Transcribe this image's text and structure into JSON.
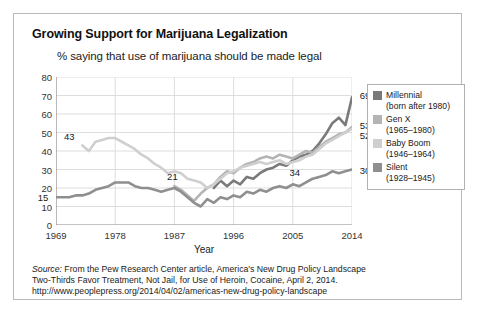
{
  "figure": {
    "title": "Growing Support for Marijuana Legalization",
    "subtitle": "% saying that use of marijuana should be made legal"
  },
  "source": {
    "prefix": "Source:",
    "line1": " From the Pew Research Center article, America's New Drug Policy Landscape",
    "line2": "Two-Thirds Favor Treatment, Not Jail, for Use of Heroin, Cocaine, April 2, 2014.",
    "line3": "http://www.peoplepress.org/2014/04/02/americas-new-drug-policy-landscape"
  },
  "legend": {
    "items": [
      {
        "name": "Millennial",
        "detail": "(born after 1980)",
        "color": "#7a7a7a"
      },
      {
        "name": "Gen X",
        "detail": "(1965–1980)",
        "color": "#b4b4b4"
      },
      {
        "name": "Baby Boom",
        "detail": "(1946–1964)",
        "color": "#cfcfcf"
      },
      {
        "name": "Silent",
        "detail": "(1928–1945)",
        "color": "#8f8f8f"
      }
    ]
  },
  "chart_data": {
    "type": "line",
    "title": "Growing Support for Marijuana Legalization",
    "subtitle": "% saying that use of marijuana should be made legal",
    "xlabel": "Year",
    "ylabel": "",
    "xlim": [
      1969,
      2014
    ],
    "ylim": [
      0,
      80
    ],
    "yticks": [
      0,
      10,
      20,
      30,
      40,
      50,
      60,
      70,
      80
    ],
    "xticks": [
      1969,
      1978,
      1987,
      1996,
      2005,
      2014
    ],
    "grid": true,
    "legend_position": "right",
    "series": [
      {
        "name": "Millennial",
        "color": "#7a7a7a",
        "end_label": "69",
        "points": [
          [
            1993,
            20
          ],
          [
            1994,
            24
          ],
          [
            1995,
            21
          ],
          [
            1996,
            24
          ],
          [
            1997,
            22
          ],
          [
            1998,
            26
          ],
          [
            1999,
            25
          ],
          [
            2000,
            28
          ],
          [
            2001,
            30
          ],
          [
            2002,
            31
          ],
          [
            2003,
            33
          ],
          [
            2004,
            32
          ],
          [
            2005,
            35
          ],
          [
            2006,
            37
          ],
          [
            2007,
            38
          ],
          [
            2008,
            40
          ],
          [
            2009,
            44
          ],
          [
            2010,
            49
          ],
          [
            2011,
            55
          ],
          [
            2012,
            58
          ],
          [
            2013,
            54
          ],
          [
            2014,
            69
          ]
        ]
      },
      {
        "name": "Gen X",
        "color": "#b4b4b4",
        "start_label": "21",
        "end_label": "53",
        "points": [
          [
            1987,
            21
          ],
          [
            1988,
            19
          ],
          [
            1989,
            16
          ],
          [
            1990,
            13
          ],
          [
            1991,
            17
          ],
          [
            1992,
            20
          ],
          [
            1993,
            22
          ],
          [
            1994,
            26
          ],
          [
            1995,
            29
          ],
          [
            1996,
            28
          ],
          [
            1997,
            31
          ],
          [
            1998,
            33
          ],
          [
            1999,
            34
          ],
          [
            2000,
            36
          ],
          [
            2001,
            37
          ],
          [
            2002,
            36
          ],
          [
            2003,
            38
          ],
          [
            2004,
            37
          ],
          [
            2005,
            36
          ],
          [
            2006,
            38
          ],
          [
            2007,
            40
          ],
          [
            2008,
            39
          ],
          [
            2009,
            42
          ],
          [
            2010,
            45
          ],
          [
            2011,
            47
          ],
          [
            2012,
            49
          ],
          [
            2013,
            50
          ],
          [
            2014,
            53
          ]
        ]
      },
      {
        "name": "Baby Boom",
        "color": "#cfcfcf",
        "start_label": "43",
        "end_label": "52",
        "points": [
          [
            1973,
            43
          ],
          [
            1974,
            40
          ],
          [
            1975,
            45
          ],
          [
            1976,
            46
          ],
          [
            1977,
            47
          ],
          [
            1978,
            47
          ],
          [
            1979,
            45
          ],
          [
            1980,
            43
          ],
          [
            1981,
            41
          ],
          [
            1982,
            38
          ],
          [
            1983,
            36
          ],
          [
            1984,
            33
          ],
          [
            1985,
            31
          ],
          [
            1986,
            28
          ],
          [
            1987,
            29
          ],
          [
            1988,
            28
          ],
          [
            1989,
            25
          ],
          [
            1990,
            24
          ],
          [
            1991,
            23
          ],
          [
            1992,
            20
          ],
          [
            1993,
            22
          ],
          [
            1994,
            25
          ],
          [
            1995,
            28
          ],
          [
            1996,
            29
          ],
          [
            1997,
            31
          ],
          [
            1998,
            32
          ],
          [
            1999,
            33
          ],
          [
            2000,
            34
          ],
          [
            2001,
            33
          ],
          [
            2002,
            34
          ],
          [
            2003,
            35
          ],
          [
            2004,
            33
          ],
          [
            2005,
            34
          ],
          [
            2006,
            35
          ],
          [
            2007,
            37
          ],
          [
            2008,
            38
          ],
          [
            2009,
            41
          ],
          [
            2010,
            44
          ],
          [
            2011,
            46
          ],
          [
            2012,
            48
          ],
          [
            2013,
            50
          ],
          [
            2014,
            52
          ]
        ]
      },
      {
        "name": "Silent",
        "color": "#8f8f8f",
        "start_label": "15",
        "mid_label": "34",
        "end_label": "30",
        "points": [
          [
            1969,
            15
          ],
          [
            1970,
            15
          ],
          [
            1971,
            15
          ],
          [
            1972,
            16
          ],
          [
            1973,
            16
          ],
          [
            1974,
            17
          ],
          [
            1975,
            19
          ],
          [
            1976,
            20
          ],
          [
            1977,
            21
          ],
          [
            1978,
            23
          ],
          [
            1979,
            23
          ],
          [
            1980,
            23
          ],
          [
            1981,
            21
          ],
          [
            1982,
            20
          ],
          [
            1983,
            20
          ],
          [
            1984,
            19
          ],
          [
            1985,
            18
          ],
          [
            1986,
            19
          ],
          [
            1987,
            20
          ],
          [
            1988,
            18
          ],
          [
            1989,
            15
          ],
          [
            1990,
            12
          ],
          [
            1991,
            10
          ],
          [
            1992,
            14
          ],
          [
            1993,
            12
          ],
          [
            1994,
            15
          ],
          [
            1995,
            14
          ],
          [
            1996,
            16
          ],
          [
            1997,
            15
          ],
          [
            1998,
            18
          ],
          [
            1999,
            17
          ],
          [
            2000,
            19
          ],
          [
            2001,
            18
          ],
          [
            2002,
            20
          ],
          [
            2003,
            21
          ],
          [
            2004,
            20
          ],
          [
            2005,
            22
          ],
          [
            2006,
            21
          ],
          [
            2007,
            23
          ],
          [
            2008,
            25
          ],
          [
            2009,
            26
          ],
          [
            2010,
            27
          ],
          [
            2011,
            29
          ],
          [
            2012,
            28
          ],
          [
            2013,
            29
          ],
          [
            2014,
            30
          ]
        ]
      }
    ],
    "annotations": [
      {
        "text": "15",
        "x": 1969,
        "y": 15
      },
      {
        "text": "43",
        "x": 1973,
        "y": 43
      },
      {
        "text": "21",
        "x": 1987,
        "y": 21
      },
      {
        "text": "34",
        "x": 2005,
        "y": 34
      },
      {
        "text": "69",
        "x": 2014,
        "y": 69
      },
      {
        "text": "53",
        "x": 2014,
        "y": 53
      },
      {
        "text": "52",
        "x": 2014,
        "y": 52
      },
      {
        "text": "30",
        "x": 2014,
        "y": 30
      }
    ]
  }
}
